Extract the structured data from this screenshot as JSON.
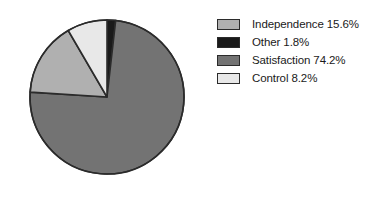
{
  "chart_data": {
    "type": "pie",
    "title": "",
    "labels": [
      "Independence",
      "Other",
      "Satisfaction",
      "Control"
    ],
    "values": [
      15.6,
      1.8,
      74.2,
      8.2
    ],
    "value_suffix": "%",
    "legend_position": "right",
    "grid": false,
    "start_angle_deg": 0,
    "direction": "clockwise",
    "slice_order_clockwise_from_top": [
      "Other",
      "Satisfaction",
      "Independence",
      "Control"
    ],
    "colors": {
      "Independence": "#b0b0b0",
      "Other": "#1a1a1a",
      "Satisfaction": "#737373",
      "Control": "#e8e8e8"
    },
    "outline_color": "#2b2b2b",
    "background": "#ffffff"
  },
  "legend": {
    "entries": [
      {
        "key": "independence",
        "label": "Independence 15.6%",
        "color": "#b0b0b0"
      },
      {
        "key": "other",
        "label": "Other 1.8%",
        "color": "#1a1a1a"
      },
      {
        "key": "satisfaction",
        "label": "Satisfaction 74.2%",
        "color": "#737373"
      },
      {
        "key": "control",
        "label": "Control 8.2%",
        "color": "#e8e8e8"
      }
    ]
  },
  "pie": {
    "center_x": 107,
    "center_y": 97,
    "radius": 77,
    "slices": [
      {
        "key": "other",
        "label": "Other",
        "value": 1.8,
        "color": "#1a1a1a",
        "start_deg": 0,
        "end_deg": 6.48
      },
      {
        "key": "satisfaction",
        "label": "Satisfaction",
        "value": 74.2,
        "color": "#737373",
        "start_deg": 6.48,
        "end_deg": 273.6
      },
      {
        "key": "independence",
        "label": "Independence",
        "value": 15.6,
        "color": "#b0b0b0",
        "start_deg": 273.6,
        "end_deg": 329.76
      },
      {
        "key": "control",
        "label": "Control",
        "value": 8.2,
        "color": "#e8e8e8",
        "start_deg": 329.76,
        "end_deg": 360
      }
    ]
  }
}
